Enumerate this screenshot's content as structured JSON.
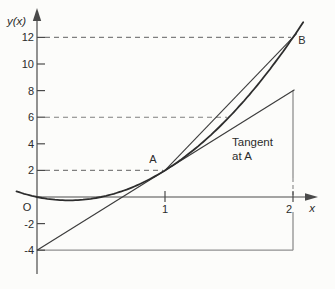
{
  "figure": {
    "description_labels": {
      "y_axis_label": "y(x)",
      "x_axis_label": "x",
      "origin_label": "O",
      "point_a_label": "A",
      "point_b_label": "B",
      "tangent_label_line1": "Tangent",
      "tangent_label_line2": "at A"
    }
  },
  "chart_data": {
    "type": "line",
    "title": "",
    "xlabel": "x",
    "ylabel": "y(x)",
    "origin_label": "O",
    "x_ticks": [
      1,
      2
    ],
    "y_ticks": [
      12,
      10,
      8,
      6,
      4,
      2,
      -2,
      -4
    ],
    "xlim": [
      -0.2,
      2.2
    ],
    "ylim": [
      -5,
      14.5
    ],
    "grid": false,
    "curve": {
      "name": "y(x)",
      "equation": "y = 4x^2 - 2x",
      "poly_coeffs": [
        4,
        -2,
        0
      ],
      "x_start": -0.16,
      "x_end": 2.08,
      "key_points": [
        [
          0,
          0
        ],
        [
          0.25,
          -0.25
        ],
        [
          0.5,
          0
        ],
        [
          1,
          2
        ],
        [
          1.5,
          6
        ],
        [
          2,
          12
        ]
      ]
    },
    "points": [
      {
        "label": "A",
        "x": 1,
        "y": 2
      },
      {
        "label": "B",
        "x": 2,
        "y": 12
      }
    ],
    "tangent": {
      "label_line1": "Tangent",
      "label_line2": "at A",
      "at_point": [
        1,
        2
      ],
      "slope": 6,
      "from": [
        0,
        -4
      ],
      "to": [
        2,
        8
      ]
    },
    "chord": {
      "from": [
        1,
        2
      ],
      "to": [
        2,
        12
      ]
    },
    "dashed_guides": [
      {
        "y": 12,
        "x_start": 0,
        "x_end": 2
      },
      {
        "y": 6,
        "x_start": 0,
        "x_end": 1.5
      },
      {
        "y": 2,
        "x_start": 0,
        "x_end": 1
      }
    ],
    "slope_triangle": {
      "vertical_x": 2,
      "vertical_from_y": 8,
      "vertical_to_y": -4,
      "horizontal_y": -4,
      "horizontal_from_x": 0,
      "horizontal_to_x": 2
    },
    "colors": {
      "ink": "#3c3c3c",
      "curve": "#2d2d2d",
      "axis": "#4a4a4a",
      "gray": "#8f8f8f",
      "dashed": "#7f7f7f",
      "text": "#2b2b2b",
      "background": "#fcfcfa"
    }
  }
}
